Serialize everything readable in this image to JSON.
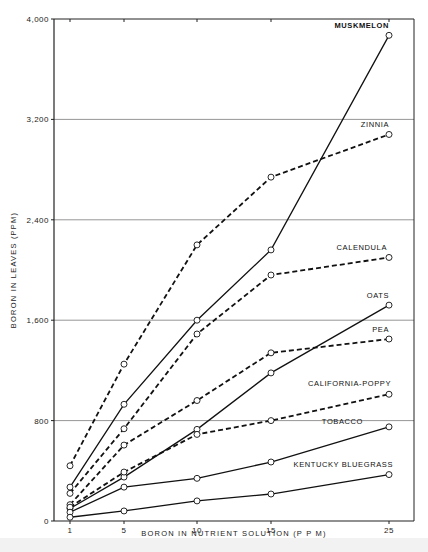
{
  "chart_data": {
    "type": "line",
    "title": "",
    "xlabel": "BORON IN NUTRIENT SOLUTION (P P M)",
    "ylabel": "BORON IN LEAVES (PPM)",
    "x": [
      1,
      5,
      10,
      15,
      25
    ],
    "x_tick_labels": [
      "1",
      "5",
      "10",
      "15",
      "25"
    ],
    "y_ticks": [
      0,
      800,
      1600,
      2400,
      3200,
      4000
    ],
    "y_tick_labels": [
      "0",
      "800",
      "1,600",
      "2,400",
      "3,200",
      "4,000"
    ],
    "ylim": [
      0,
      4000
    ],
    "grid": "horizontal",
    "legend": "inline labels at right end of each line",
    "series": [
      {
        "name": "MUSKMELON",
        "style": "solid",
        "values": [
          270,
          930,
          1600,
          2160,
          3870
        ]
      },
      {
        "name": "ZINNIA",
        "style": "dashed",
        "values": [
          440,
          1250,
          2200,
          2740,
          3080
        ]
      },
      {
        "name": "CALENDULA",
        "style": "dashed",
        "values": [
          220,
          735,
          1490,
          1960,
          2100
        ]
      },
      {
        "name": "OATS",
        "style": "solid",
        "values": [
          100,
          350,
          730,
          1180,
          1720
        ]
      },
      {
        "name": "PEA",
        "style": "dashed",
        "values": [
          130,
          605,
          960,
          1340,
          1450
        ]
      },
      {
        "name": "CALIFORNIA-POPPY",
        "style": "dashed",
        "values": [
          110,
          390,
          690,
          800,
          1010
        ]
      },
      {
        "name": "TOBACCO",
        "style": "solid",
        "values": [
          70,
          270,
          340,
          470,
          750
        ]
      },
      {
        "name": "KENTUCKY BLUEGRASS",
        "style": "solid",
        "values": [
          30,
          80,
          160,
          215,
          370
        ]
      }
    ]
  }
}
